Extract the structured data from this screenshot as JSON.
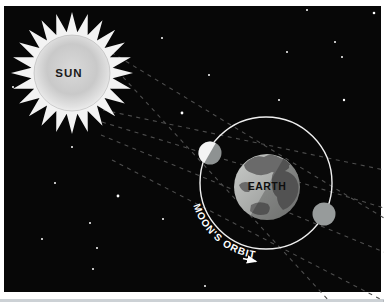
{
  "canvas": {
    "width": 384,
    "height": 302
  },
  "colors": {
    "frame": "#ffffff",
    "frame_bottom_edge": "#ccd1d5",
    "space": "#070707",
    "star": "#ffffff",
    "ray_dash": "#4e4e4e",
    "orbit_stroke": "#efefef",
    "sun_spike": "#f3f3f3",
    "sun_label": "#1a1a1a",
    "earth_label": "#0e0e0e",
    "orbit_label": "#ffffff",
    "moon_lit": "#f4f4f4",
    "moon_shadow": "#8e9292",
    "moon_eclipsed": "#979b9b",
    "earth_continent": "#6a6a6a"
  },
  "sun": {
    "label": "SUN",
    "cx": 72,
    "cy": 73,
    "disc_r": 38,
    "spike_inner_r": 41,
    "spike_outer_r": 61,
    "spike_count": 24
  },
  "earth": {
    "label": "EARTH",
    "cx": 267,
    "cy": 187,
    "r": 33
  },
  "moon_orbit": {
    "label": "MOON'S ORBIT",
    "cx": 266,
    "cy": 183,
    "r": 66,
    "direction": "clockwise-arrow at lower left"
  },
  "moons": [
    {
      "name": "moon-near-sun",
      "cx": 210,
      "cy": 153,
      "r": 11.5,
      "phase": "half lit toward sun"
    },
    {
      "name": "moon-in-earth-shadow",
      "cx": 324,
      "cy": 214,
      "r": 11.5,
      "phase": "fully shadowed"
    }
  ],
  "light_rays": [
    [
      104,
      48,
      384,
      218
    ],
    [
      100,
      52,
      330,
      302
    ],
    [
      103,
      110,
      384,
      170
    ],
    [
      102,
      122,
      384,
      208
    ],
    [
      101,
      135,
      384,
      252
    ],
    [
      112,
      160,
      384,
      301
    ]
  ],
  "stars": [
    [
      13,
      87,
      1
    ],
    [
      72,
      147,
      1
    ],
    [
      162,
      38,
      1
    ],
    [
      182,
      113,
      1.4
    ],
    [
      209,
      75,
      1
    ],
    [
      287,
      52,
      1
    ],
    [
      307,
      10,
      1
    ],
    [
      374,
      13,
      1.3
    ],
    [
      335,
      42,
      1
    ],
    [
      342,
      57,
      1
    ],
    [
      279,
      100,
      1
    ],
    [
      344,
      100,
      1.2
    ],
    [
      55,
      183,
      1
    ],
    [
      118,
      196,
      1.4
    ],
    [
      90,
      223,
      1
    ],
    [
      42,
      239,
      1
    ],
    [
      163,
      219,
      1
    ],
    [
      97,
      248,
      1
    ],
    [
      93,
      269,
      1
    ],
    [
      205,
      286,
      1
    ]
  ]
}
